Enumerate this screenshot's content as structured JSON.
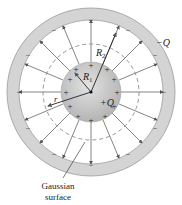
{
  "diagram": {
    "labels": {
      "outer_charge": "−Q",
      "inner_charge": "+Q",
      "inner_radius": "R",
      "inner_radius_sub": "1",
      "outer_radius": "R",
      "outer_radius_sub": "2",
      "gaussian_radius": "r",
      "gaussian_line1": "Gaussian",
      "gaussian_line2": "surface"
    },
    "symbols": {
      "plus": "+",
      "minus": "−"
    },
    "colors": {
      "outer_shell": "#d6d6d6",
      "outer_shell_edge": "#9a9a9a",
      "inner_sphere": "#c4c4c4",
      "field_lines": "#666666",
      "gaussian_dash": "#8a8a8a"
    }
  }
}
